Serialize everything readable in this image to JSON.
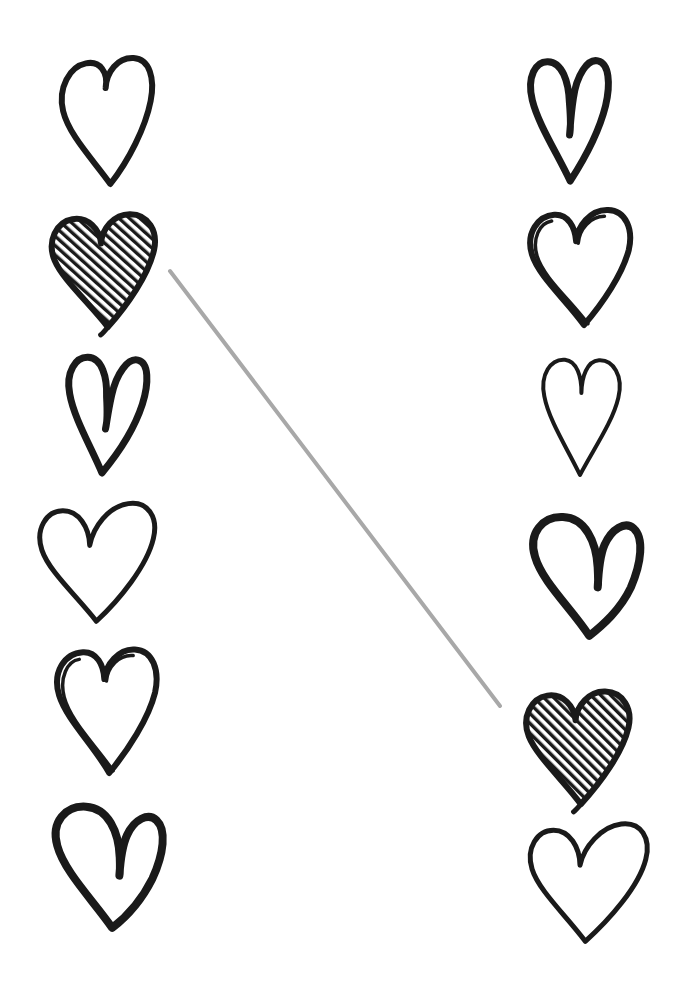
{
  "page": {
    "width": 680,
    "height": 996,
    "background_color": "#ffffff",
    "ink_color": "#1a1a1a"
  },
  "connector": {
    "name": "match-line",
    "color": "#a8a8a8",
    "width": 4,
    "x1": 170,
    "y1": 271,
    "x2": 500,
    "y2": 706,
    "from": "left-heart-2",
    "to": "right-heart-5",
    "label": "matching line"
  },
  "left_column": {
    "label": "Left column of hearts",
    "hearts": [
      {
        "id": "left-heart-1",
        "label": "Wide outline heart",
        "style": "outline",
        "fill": "none",
        "x": 60,
        "y": 58,
        "w": 96,
        "h": 128,
        "rotate": -4,
        "stroke": 6
      },
      {
        "id": "left-heart-2",
        "label": "Hatched filled heart",
        "style": "hatched",
        "fill": "diagonal-hatch",
        "x": 50,
        "y": 213,
        "w": 112,
        "h": 116,
        "rotate": -6,
        "stroke": 6
      },
      {
        "id": "left-heart-3",
        "label": "Narrow notched heart",
        "style": "narrow-notch",
        "fill": "none",
        "x": 62,
        "y": 353,
        "w": 86,
        "h": 122,
        "rotate": 2,
        "stroke": 7
      },
      {
        "id": "left-heart-4",
        "label": "Wide tilted heart",
        "style": "wide-tilted",
        "fill": "none",
        "x": 38,
        "y": 500,
        "w": 126,
        "h": 122,
        "rotate": -8,
        "stroke": 5
      },
      {
        "id": "left-heart-5",
        "label": "Double stroke sketchy heart",
        "style": "double-stroke",
        "fill": "none",
        "x": 52,
        "y": 645,
        "w": 110,
        "h": 132,
        "rotate": -3,
        "stroke": 6
      },
      {
        "id": "left-heart-6",
        "label": "Asymmetric heart with large left lobe",
        "style": "asymmetric",
        "fill": "none",
        "x": 52,
        "y": 800,
        "w": 110,
        "h": 130,
        "rotate": -2,
        "stroke": 8
      }
    ]
  },
  "right_column": {
    "label": "Right column of hearts",
    "hearts": [
      {
        "id": "right-heart-1",
        "label": "Narrow notched heart",
        "style": "narrow-notch",
        "fill": "none",
        "x": 524,
        "y": 55,
        "w": 90,
        "h": 128,
        "rotate": -2,
        "stroke": 7
      },
      {
        "id": "right-heart-2",
        "label": "Double stroke sketchy heart",
        "style": "double-stroke",
        "fill": "none",
        "x": 526,
        "y": 207,
        "w": 112,
        "h": 122,
        "rotate": -4,
        "stroke": 6
      },
      {
        "id": "right-heart-3",
        "label": "Thin symmetric heart",
        "style": "thin-outline",
        "fill": "none",
        "x": 538,
        "y": 355,
        "w": 86,
        "h": 122,
        "rotate": 1,
        "stroke": 4
      },
      {
        "id": "right-heart-4",
        "label": "Bold asymmetric heart",
        "style": "asymmetric",
        "fill": "none",
        "x": 530,
        "y": 510,
        "w": 110,
        "h": 128,
        "rotate": -3,
        "stroke": 8
      },
      {
        "id": "right-heart-5",
        "label": "Hatched filled heart",
        "style": "hatched",
        "fill": "diagonal-hatch",
        "x": 524,
        "y": 690,
        "w": 112,
        "h": 116,
        "rotate": -5,
        "stroke": 6
      },
      {
        "id": "right-heart-6",
        "label": "Wide tilted heart",
        "style": "wide-tilted",
        "fill": "none",
        "x": 528,
        "y": 820,
        "w": 128,
        "h": 122,
        "rotate": -7,
        "stroke": 5
      }
    ]
  }
}
